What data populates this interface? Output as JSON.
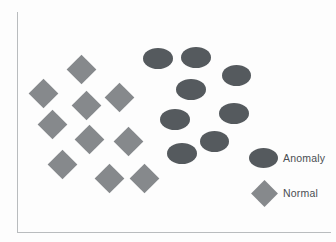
{
  "figure": {
    "title": "",
    "background_color": "#fdfdfd",
    "axis_color": "#b9bcbe"
  },
  "legend": {
    "position": "bottom-right",
    "entries": [
      {
        "label": "Anomaly",
        "marker": "ellipse",
        "color": "#555a5e",
        "marker_x": 263,
        "marker_y": 158,
        "marker_w": 29,
        "marker_h": 20,
        "label_x": 283,
        "label_y": 153
      },
      {
        "label": "Normal",
        "marker": "diamond",
        "color": "#86898c",
        "marker_x": 264,
        "marker_y": 193,
        "marker_size": 19,
        "label_x": 283,
        "label_y": 188
      }
    ]
  },
  "chart_data": {
    "type": "scatter",
    "title": "",
    "xlabel": "",
    "ylabel": "",
    "grid": false,
    "xlim": [
      17,
      331
    ],
    "ylim": [
      12,
      232
    ],
    "legend_position": "bottom-right",
    "series": [
      {
        "name": "Anomaly",
        "marker": "ellipse",
        "color": "#555a5e",
        "points": [
          {
            "x": 158,
            "y": 58,
            "w": 30,
            "h": 21
          },
          {
            "x": 196,
            "y": 57,
            "w": 30,
            "h": 21
          },
          {
            "x": 236,
            "y": 75,
            "w": 29,
            "h": 21
          },
          {
            "x": 191,
            "y": 89,
            "w": 30,
            "h": 21
          },
          {
            "x": 175,
            "y": 119,
            "w": 30,
            "h": 21
          },
          {
            "x": 234,
            "y": 113,
            "w": 30,
            "h": 21
          },
          {
            "x": 214,
            "y": 141,
            "w": 29,
            "h": 21
          },
          {
            "x": 182,
            "y": 153,
            "w": 30,
            "h": 21
          }
        ]
      },
      {
        "name": "Normal",
        "marker": "diamond",
        "color": "#86898c",
        "points": [
          {
            "x": 81,
            "y": 69,
            "size": 21
          },
          {
            "x": 43,
            "y": 93,
            "size": 21
          },
          {
            "x": 86,
            "y": 105,
            "size": 21
          },
          {
            "x": 119,
            "y": 97,
            "size": 21
          },
          {
            "x": 52,
            "y": 124,
            "size": 21
          },
          {
            "x": 89,
            "y": 139,
            "size": 21
          },
          {
            "x": 128,
            "y": 141,
            "size": 21
          },
          {
            "x": 62,
            "y": 164,
            "size": 21
          },
          {
            "x": 109,
            "y": 178,
            "size": 21
          },
          {
            "x": 144,
            "y": 178,
            "size": 21
          }
        ]
      }
    ]
  }
}
